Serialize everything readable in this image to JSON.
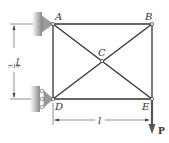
{
  "diagram": {
    "type": "truss",
    "nodes": [
      {
        "id": "A",
        "label": "A",
        "x": 53,
        "y": 24
      },
      {
        "id": "B",
        "label": "B",
        "x": 152,
        "y": 24
      },
      {
        "id": "C",
        "label": "C",
        "x": 102,
        "y": 61
      },
      {
        "id": "D",
        "label": "D",
        "x": 53,
        "y": 99
      },
      {
        "id": "E",
        "label": "E",
        "x": 152,
        "y": 99
      }
    ],
    "members": [
      [
        "A",
        "B"
      ],
      [
        "B",
        "E"
      ],
      [
        "D",
        "E"
      ],
      [
        "A",
        "D"
      ],
      [
        "A",
        "C"
      ],
      [
        "C",
        "E"
      ],
      [
        "B",
        "C"
      ],
      [
        "C",
        "D"
      ]
    ],
    "supports": [
      {
        "node": "A",
        "type": "pin"
      },
      {
        "node": "D",
        "type": "roller"
      }
    ],
    "loads": [
      {
        "node": "E",
        "label": "P",
        "direction": "down"
      }
    ],
    "dimensions": {
      "vertical": {
        "numerator": "3",
        "denominator": "4",
        "var": "l"
      },
      "horizontal": {
        "var": "l"
      }
    },
    "colors": {
      "member": "#333333",
      "support": "#888888",
      "load": "#555555"
    }
  }
}
